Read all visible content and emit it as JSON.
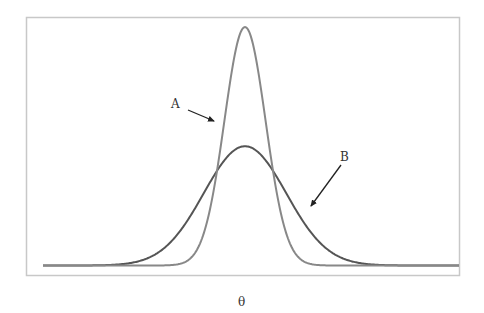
{
  "chart_data": {
    "type": "line",
    "title": "",
    "xlabel": "θ",
    "ylabel": "",
    "grid": false,
    "legend": "none",
    "annotations": [
      {
        "text": "A",
        "target": "narrow tall curve",
        "label_pos": [
          176,
          103
        ],
        "arrow_from": [
          188,
          110
        ],
        "arrow_to": [
          215,
          121
        ]
      },
      {
        "text": "B",
        "target": "wide short curve",
        "label_pos": [
          345,
          156
        ],
        "arrow_from": [
          341,
          165
        ],
        "arrow_to": [
          310,
          207
        ]
      }
    ],
    "series": [
      {
        "name": "A",
        "distribution": "normal",
        "mean": 0,
        "sd": 1,
        "relative_peak": 2,
        "color": "#808080"
      },
      {
        "name": "B",
        "distribution": "normal",
        "mean": 0,
        "sd": 2,
        "relative_peak": 1,
        "color": "#5a5a5a"
      }
    ],
    "xlim": [
      -9.8,
      10.4
    ],
    "ylim": [
      0,
      2.2
    ]
  },
  "labels": {
    "a": "A",
    "b": "B",
    "x_axis": "θ"
  },
  "colors": {
    "frame": "#c8c8c8",
    "curve_a": "#888888",
    "curve_b": "#555555",
    "arrow": "#222222"
  }
}
